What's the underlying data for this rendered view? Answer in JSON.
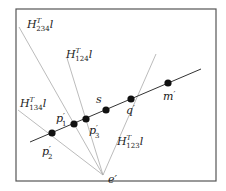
{
  "diagram": {
    "frame": {
      "x": 16,
      "y": 9,
      "width": 200,
      "height": 172,
      "stroke": "#555555"
    },
    "main_line": {
      "name": "l",
      "x1": 30,
      "y1": 142,
      "x2": 201,
      "y2": 69,
      "stroke": "#333333"
    },
    "epipole": {
      "label": "e'",
      "x": 103,
      "y": 175,
      "label_x": 108,
      "label_y": 183
    },
    "hyperplane_lines": [
      {
        "id": "H234",
        "base": "H",
        "sup": "T",
        "sub": "234",
        "suffix": "l",
        "x1": 103,
        "y1": 175,
        "x2": 19,
        "y2": 27,
        "label_x": 27,
        "label_y": 28
      },
      {
        "id": "H124",
        "base": "H",
        "sup": "T",
        "sub": "124",
        "suffix": "l",
        "x1": 103,
        "y1": 175,
        "x2": 67,
        "y2": 58,
        "label_x": 66,
        "label_y": 58
      },
      {
        "id": "H134",
        "base": "H",
        "sup": "T",
        "sub": "134",
        "suffix": "l",
        "x1": 103,
        "y1": 175,
        "x2": 18,
        "y2": 110,
        "label_x": 20,
        "label_y": 107
      },
      {
        "id": "H123",
        "base": "H",
        "sup": "T",
        "sub": "123",
        "suffix": "l",
        "x1": 103,
        "y1": 175,
        "x2": 156,
        "y2": 54,
        "label_x": 117,
        "label_y": 145
      }
    ],
    "points": [
      {
        "id": "p2",
        "label": "p",
        "sub": "2",
        "x": 52,
        "y": 133,
        "label_x": 42,
        "label_y": 155
      },
      {
        "id": "p1",
        "label": "p",
        "sub": "1",
        "x": 74,
        "y": 124,
        "label_x": 56,
        "label_y": 122
      },
      {
        "id": "p3",
        "label": "p",
        "sub": "3",
        "x": 86,
        "y": 119,
        "label_x": 89,
        "label_y": 134
      },
      {
        "id": "s",
        "label": "s",
        "sub": "",
        "x": 106,
        "y": 110,
        "label_x": 96,
        "label_y": 103
      },
      {
        "id": "q",
        "label": "q",
        "sub": "",
        "x": 131,
        "y": 99,
        "label_x": 126,
        "label_y": 114
      },
      {
        "id": "m",
        "label": "m",
        "sub": "",
        "x": 168,
        "y": 83,
        "label_x": 163,
        "label_y": 100
      }
    ],
    "line_color": "#aaaaaa",
    "point_color": "#111111"
  }
}
